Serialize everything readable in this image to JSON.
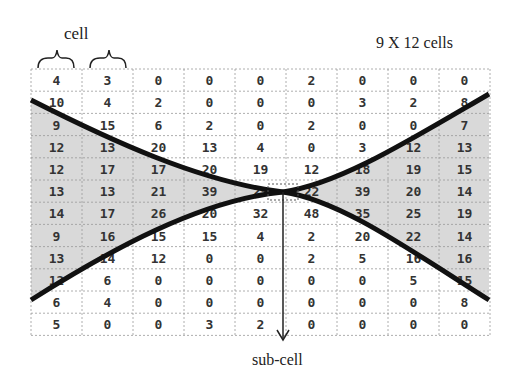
{
  "labels": {
    "cell": "cell",
    "grid_size": "9 X 12 cells",
    "sub_cell": "sub-cell"
  },
  "grid": {
    "columns": 9,
    "rows": 12,
    "values": [
      [
        "4",
        "3",
        "0",
        "0",
        "0",
        "2",
        "0",
        "0",
        "0"
      ],
      [
        "10",
        "4",
        "2",
        "0",
        "0",
        "0",
        "3",
        "2",
        "8"
      ],
      [
        "9",
        "15",
        "6",
        "2",
        "0",
        "2",
        "0",
        "0",
        "7"
      ],
      [
        "12",
        "13",
        "20",
        "13",
        "4",
        "0",
        "3",
        "12",
        "13"
      ],
      [
        "12",
        "17",
        "17",
        "20",
        "19",
        "12",
        "18",
        "19",
        "15"
      ],
      [
        "13",
        "13",
        "21",
        "39",
        "25",
        "22",
        "39",
        "20",
        "14"
      ],
      [
        "14",
        "17",
        "26",
        "20",
        "32",
        "48",
        "35",
        "25",
        "19"
      ],
      [
        "9",
        "16",
        "15",
        "15",
        "4",
        "2",
        "20",
        "22",
        "14"
      ],
      [
        "13",
        "14",
        "12",
        "0",
        "0",
        "2",
        "5",
        "16",
        "16"
      ],
      [
        "12",
        "6",
        "0",
        "0",
        "0",
        "0",
        "0",
        "5",
        "15"
      ],
      [
        "6",
        "4",
        "0",
        "0",
        "0",
        "0",
        "0",
        "0",
        "8"
      ],
      [
        "5",
        "0",
        "0",
        "3",
        "2",
        "0",
        "0",
        "0",
        "0"
      ]
    ]
  },
  "colors": {
    "shade": "#d9d9d9",
    "curve": "#111111",
    "grid_line": "#999999",
    "text": "#333333"
  }
}
